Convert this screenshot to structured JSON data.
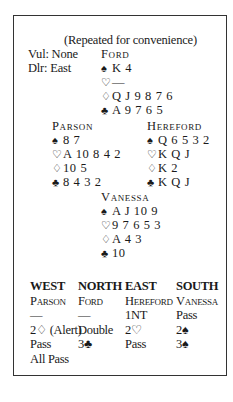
{
  "caption": "(Repeated for convenience)",
  "vul": "Vul: None",
  "dealer": "Dlr: East",
  "suit_symbols": {
    "spades": "♠",
    "hearts": "♡",
    "diamonds": "♢",
    "clubs": "♣"
  },
  "hands": {
    "north": {
      "name": "Ford",
      "spades": "K 4",
      "hearts": "—",
      "diamonds": "Q J 9 8 7 6",
      "clubs": "A 9 7 6 5"
    },
    "west": {
      "name": "Parson",
      "spades": "8 7",
      "hearts": "A 10 8 4 2",
      "diamonds": "10 5",
      "clubs": "8 4 3 2"
    },
    "east": {
      "name": "Hereford",
      "spades": "Q 6 5 3 2",
      "hearts": "K Q J",
      "diamonds": "K 2",
      "clubs": "K Q J"
    },
    "south": {
      "name": "Vanessa",
      "spades": "A J 10 9",
      "hearts": "9 7 6 5 3",
      "diamonds": "A 4 3",
      "clubs": "10"
    }
  },
  "auction": {
    "columns": [
      {
        "header": "WEST",
        "player": "Parson",
        "calls": [
          "—",
          "2♢ (Alert)",
          "Pass",
          "All Pass"
        ]
      },
      {
        "header": "NORTH",
        "player": "Ford",
        "calls": [
          "—",
          "Double",
          "3♣",
          ""
        ]
      },
      {
        "header": "EAST",
        "player": "Hereford",
        "calls": [
          "1NT",
          "2♡",
          "Pass",
          ""
        ]
      },
      {
        "header": "SOUTH",
        "player": "Vanessa",
        "calls": [
          "Pass",
          "2♠",
          "3♠",
          ""
        ]
      }
    ]
  }
}
